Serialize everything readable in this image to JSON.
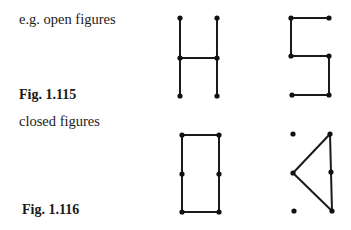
{
  "labels": {
    "open_caption": "e.g. open figures",
    "fig_open": "Fig. 1.115",
    "closed_caption": "closed figures",
    "fig_closed": "Fig. 1.116"
  },
  "figures": {
    "open": [
      {
        "name": "H-shape",
        "segments": [
          [
            180,
            18,
            180,
            96
          ],
          [
            217,
            18,
            217,
            96
          ],
          [
            180,
            58,
            217,
            58
          ]
        ],
        "dots": [
          [
            180,
            18
          ],
          [
            217,
            18
          ],
          [
            180,
            58
          ],
          [
            217,
            58
          ],
          [
            180,
            96
          ],
          [
            217,
            96
          ]
        ]
      },
      {
        "name": "S-shape",
        "segments": [
          [
            291,
            18,
            329,
            18
          ],
          [
            291,
            18,
            291,
            56
          ],
          [
            291,
            56,
            329,
            56
          ],
          [
            329,
            56,
            329,
            95
          ],
          [
            329,
            95,
            292,
            95
          ]
        ],
        "dots": [
          [
            291,
            18
          ],
          [
            329,
            18
          ],
          [
            291,
            56
          ],
          [
            329,
            56
          ],
          [
            292,
            95
          ],
          [
            329,
            95
          ]
        ]
      }
    ],
    "closed": [
      {
        "name": "rectangle",
        "segments": [
          [
            182,
            135,
            219,
            135
          ],
          [
            219,
            135,
            219,
            212
          ],
          [
            219,
            212,
            182,
            212
          ],
          [
            182,
            212,
            182,
            135
          ]
        ],
        "dots": [
          [
            182,
            135
          ],
          [
            219,
            135
          ],
          [
            182,
            174
          ],
          [
            219,
            174
          ],
          [
            182,
            212
          ],
          [
            219,
            212
          ]
        ]
      },
      {
        "name": "triangle",
        "segments": [
          [
            330,
            134,
            293,
            173
          ],
          [
            293,
            173,
            332,
            211
          ],
          [
            332,
            211,
            330,
            134
          ]
        ],
        "dots": [
          [
            293,
            134
          ],
          [
            330,
            134
          ],
          [
            293,
            173
          ],
          [
            331,
            172
          ],
          [
            294,
            211
          ],
          [
            332,
            211
          ]
        ]
      }
    ]
  }
}
